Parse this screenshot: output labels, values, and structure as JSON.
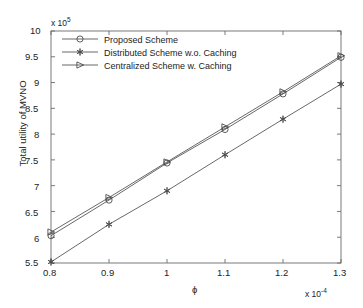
{
  "chart_data": {
    "type": "line",
    "title": "",
    "xlabel": "ϕ",
    "ylabel": "Total utility of MVNO",
    "x_multiplier": "x 10",
    "x_exponent": "-4",
    "y_multiplier": "x 10",
    "y_exponent": "5",
    "xlim": [
      0.8,
      1.3
    ],
    "ylim": [
      5.5,
      10
    ],
    "xticks": [
      "0.8",
      "0.9",
      "1",
      "1.1",
      "1.2",
      "1.3"
    ],
    "xtick_values": [
      0.8,
      0.9,
      1.0,
      1.1,
      1.2,
      1.3
    ],
    "yticks": [
      "5.5",
      "6",
      "6.5",
      "7",
      "7.5",
      "8",
      "8.5",
      "9",
      "9.5",
      "10"
    ],
    "ytick_values": [
      5.5,
      6.0,
      6.5,
      7.0,
      7.5,
      8.0,
      8.5,
      9.0,
      9.5,
      10.0
    ],
    "grid": false,
    "legend_position": "upper left",
    "x": [
      0.8,
      0.9,
      1.0,
      1.1,
      1.2,
      1.3
    ],
    "series": [
      {
        "name": "Proposed Scheme",
        "marker": "circle",
        "color": "#4d4d4d",
        "values": [
          6.03,
          6.72,
          7.44,
          8.09,
          8.78,
          9.49
        ]
      },
      {
        "name": "Distributed Scheme w.o. Caching",
        "marker": "asterisk",
        "color": "#4d4d4d",
        "values": [
          5.52,
          6.25,
          6.9,
          7.6,
          8.29,
          8.97
        ]
      },
      {
        "name": "Centralized Scheme w. Caching",
        "marker": "right-triangle",
        "color": "#4d4d4d",
        "values": [
          6.1,
          6.77,
          7.46,
          8.14,
          8.82,
          9.52
        ]
      }
    ]
  },
  "axes": {
    "y_multiplier_label": "x 10",
    "y_multiplier_exp": "5",
    "x_multiplier_label": "x 10",
    "x_multiplier_exp": "-4",
    "x_axis_title": "ϕ",
    "y_axis_title": "Total utility of MVNO"
  },
  "legend": {
    "entries": [
      {
        "label": "Proposed Scheme",
        "marker": "circle-marker-icon"
      },
      {
        "label": "Distributed Scheme w.o. Caching",
        "marker": "asterisk-marker-icon"
      },
      {
        "label": "Centralized Scheme w. Caching",
        "marker": "triangle-marker-icon"
      }
    ]
  }
}
